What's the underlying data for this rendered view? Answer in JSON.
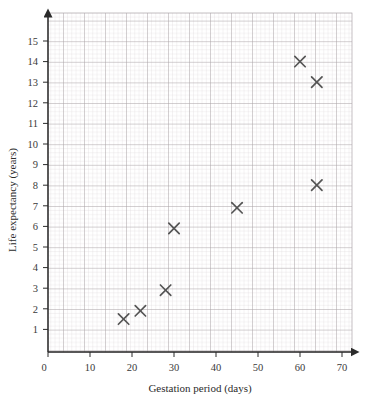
{
  "chart_data": {
    "type": "scatter",
    "title": "",
    "xlabel": "Gestation period (days)",
    "ylabel": "Life expectancy (years)",
    "xlim": [
      0,
      75
    ],
    "ylim": [
      0,
      15.6
    ],
    "xticks": [
      0,
      10,
      20,
      30,
      40,
      50,
      60,
      70
    ],
    "yticks": [
      1,
      2,
      3,
      4,
      5,
      6,
      7,
      8,
      9,
      10,
      11,
      12,
      13,
      14,
      15
    ],
    "grid": "graph-paper-2mm-with-10mm-major",
    "legend": "none",
    "marker": "x-cross",
    "marker_color": "#555555",
    "points": [
      {
        "x": 18,
        "y": 1.6
      },
      {
        "x": 22,
        "y": 2.0
      },
      {
        "x": 28,
        "y": 3.0
      },
      {
        "x": 30,
        "y": 6.0
      },
      {
        "x": 45,
        "y": 7.0
      },
      {
        "x": 60,
        "y": 14.1
      },
      {
        "x": 64,
        "y": 13.1
      },
      {
        "x": 64,
        "y": 8.1
      }
    ]
  },
  "axes": {
    "x": {
      "label": "Gestation period (days)",
      "tick_labels": [
        "0",
        "10",
        "20",
        "30",
        "40",
        "50",
        "60",
        "70"
      ]
    },
    "y": {
      "label": "Life expectancy (years)",
      "tick_labels": [
        "1",
        "2",
        "3",
        "4",
        "5",
        "6",
        "7",
        "8",
        "9",
        "10",
        "11",
        "12",
        "13",
        "14",
        "15"
      ]
    }
  },
  "colors": {
    "grid_minor": "#d9d3d6",
    "grid_major": "#aba4a8",
    "axis": "#2b2b2b",
    "marker": "#555555",
    "background": "#ffffff"
  }
}
